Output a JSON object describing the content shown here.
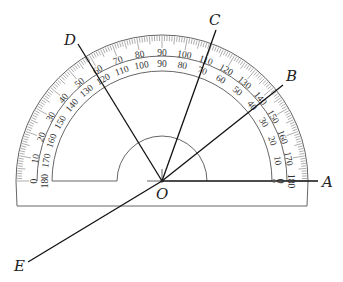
{
  "diagram": {
    "center": {
      "x": 162,
      "y": 181
    },
    "protractor": {
      "outer_radius": 146,
      "base_y": 206,
      "outer_scale_ring_radius": 125,
      "inner_scale_ring_radius": 110,
      "small_semicircle_radius": 45,
      "outer_scale_labels": [
        "0",
        "10",
        "20",
        "30",
        "40",
        "50",
        "60",
        "70",
        "80",
        "90",
        "100",
        "110",
        "120",
        "130",
        "140",
        "150",
        "160",
        "170",
        "180"
      ],
      "inner_scale_labels": [
        "180",
        "170",
        "160",
        "150",
        "140",
        "130",
        "120",
        "110",
        "100",
        "90",
        "80",
        "70",
        "60",
        "50",
        "40",
        "30",
        "20",
        "10",
        "0"
      ]
    },
    "points": [
      {
        "name": "O",
        "label": "O",
        "x": 162,
        "y": 181,
        "label_x": 156,
        "label_y": 199
      },
      {
        "name": "A",
        "label": "A",
        "x": 318,
        "y": 181,
        "label_x": 322,
        "label_y": 187
      },
      {
        "name": "B",
        "label": "B",
        "x": 283,
        "y": 85,
        "label_x": 286,
        "label_y": 81
      },
      {
        "name": "C",
        "label": "C",
        "x": 216,
        "y": 30,
        "label_x": 209,
        "label_y": 25
      },
      {
        "name": "D",
        "label": "D",
        "x": 78,
        "y": 44,
        "label_x": 64,
        "label_y": 45
      },
      {
        "name": "E",
        "label": "E",
        "x": 28,
        "y": 262,
        "label_x": 14,
        "label_y": 271
      }
    ],
    "rays": [
      {
        "name": "OA",
        "from": "O",
        "to": "A",
        "outer_scale_degree": 0,
        "inner_scale_degree": 180
      },
      {
        "name": "OB",
        "from": "O",
        "to": "B",
        "outer_scale_degree": 140,
        "inner_scale_degree": 40
      },
      {
        "name": "OC",
        "from": "O",
        "to": "C",
        "outer_scale_degree": 110,
        "inner_scale_degree": 70
      },
      {
        "name": "OD",
        "from": "O",
        "to": "D",
        "outer_scale_degree": 60,
        "inner_scale_degree": 120
      },
      {
        "name": "OE",
        "from": "O",
        "to": "E",
        "note": "extension of ray OB through O"
      }
    ]
  }
}
